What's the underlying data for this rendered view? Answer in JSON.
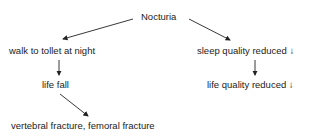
{
  "diagram": {
    "root": "Nocturia",
    "left_branch": {
      "n1": "walk to tollet at night",
      "n2": "life fall",
      "n3": "vertebral fracture, femoral fracture"
    },
    "right_branch": {
      "n1": "sleep quality reduced ↓",
      "n2": "life quality reduced ↓"
    },
    "colors": {
      "text": "#222222",
      "arrow": "#222222",
      "background": "#ffffff"
    }
  }
}
